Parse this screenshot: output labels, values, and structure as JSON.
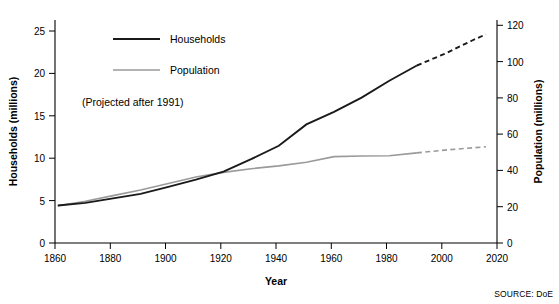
{
  "chart_data": {
    "type": "line",
    "title": "",
    "xlabel": "Year",
    "ylabel": "Households (millions)",
    "y2label": "Population (millions)",
    "annotation": "(Projected after 1991)",
    "source": "SOURCE: DoE",
    "grid": false,
    "legend_position": "top-center-left",
    "xlim": [
      1860,
      2020
    ],
    "xticks": [
      1860,
      1880,
      1900,
      1920,
      1940,
      1960,
      1980,
      2000,
      2020
    ],
    "ylim": [
      0,
      25
    ],
    "yticks": [
      0,
      5,
      10,
      15,
      20,
      25
    ],
    "y2lim": [
      0,
      120
    ],
    "y2ticks": [
      0,
      20,
      40,
      60,
      80,
      100,
      120
    ],
    "projection_start_year": 1991,
    "series": [
      {
        "name": "Households",
        "axis": "left",
        "color": "#1a1a1a",
        "x": [
          1861,
          1871,
          1881,
          1891,
          1901,
          1911,
          1921,
          1931,
          1941,
          1951,
          1961,
          1971,
          1981,
          1991
        ],
        "values": [
          4.2,
          4.5,
          5.0,
          5.5,
          6.3,
          7.1,
          8.0,
          9.4,
          10.9,
          13.3,
          14.7,
          16.3,
          18.2,
          19.9
        ],
        "projected_x": [
          1991,
          2001,
          2011,
          2016
        ],
        "projected_values": [
          19.9,
          21.2,
          22.7,
          23.4
        ]
      },
      {
        "name": "Population",
        "axis": "right",
        "color": "#9a9a9a",
        "x": [
          1861,
          1871,
          1881,
          1891,
          1901,
          1911,
          1921,
          1931,
          1941,
          1951,
          1961,
          1971,
          1981,
          1991
        ],
        "values": [
          20.0,
          22.5,
          25.5,
          28.5,
          32.0,
          35.5,
          38.0,
          40.0,
          41.5,
          43.5,
          46.5,
          46.8,
          47.0,
          48.5
        ],
        "projected_x": [
          1991,
          2001,
          2011,
          2016
        ],
        "projected_values": [
          48.5,
          50.0,
          51.2,
          51.8
        ]
      }
    ]
  },
  "legend": {
    "items": [
      {
        "label": "Households",
        "color": "#1a1a1a"
      },
      {
        "label": "Population",
        "color": "#9a9a9a"
      }
    ]
  },
  "axes": {
    "x_title": "Year",
    "y_left_title": "Households (millions)",
    "y_right_title": "Population (millions)",
    "x_ticks": [
      "1860",
      "1880",
      "1900",
      "1920",
      "1940",
      "1960",
      "1980",
      "2000",
      "2020"
    ],
    "y_left_ticks": [
      "25",
      "20",
      "15",
      "10",
      "5",
      "0"
    ],
    "y_right_ticks": [
      "120",
      "100",
      "80",
      "60",
      "40",
      "20",
      "0"
    ]
  },
  "annotation": {
    "text": "(Projected after 1991)"
  },
  "source": {
    "text": "SOURCE: DoE"
  }
}
